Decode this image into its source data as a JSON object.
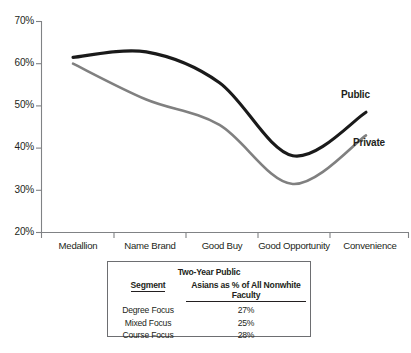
{
  "chart_data": {
    "type": "line",
    "title": "",
    "xlabel": "",
    "ylabel": "",
    "ylim": [
      20,
      70
    ],
    "ytick_labels": [
      "70%",
      "60%",
      "50%",
      "40%",
      "30%",
      "20%"
    ],
    "ytick_values": [
      70,
      60,
      50,
      40,
      30,
      20
    ],
    "grid": false,
    "legend_position": "inline-right-of-line-ends",
    "categories": [
      "Medallion",
      "Name Brand",
      "Good Buy",
      "Good Opportunity",
      "Convenience"
    ],
    "series": [
      {
        "name": "Public",
        "color": "#1a1a1a",
        "values": [
          61.5,
          62.8,
          55.5,
          38.2,
          48.5
        ]
      },
      {
        "name": "Private",
        "color": "#808080",
        "values": [
          60.0,
          51.5,
          45.5,
          31.5,
          43.0
        ]
      }
    ],
    "annotations": [
      {
        "text": "Public",
        "series": "Public"
      },
      {
        "text": "Private",
        "series": "Private"
      }
    ]
  },
  "table": {
    "title": "Two-Year Public",
    "columns": [
      "Segment",
      "Asians as % of All Nonwhite Faculty"
    ],
    "rows": [
      {
        "segment": "Degree Focus",
        "value": "27%"
      },
      {
        "segment": "Mixed Focus",
        "value": "25%"
      },
      {
        "segment": "Course Focus",
        "value": "28%"
      }
    ]
  },
  "colors": {
    "public_line": "#1a1a1a",
    "private_line": "#808080",
    "axis": "#808285",
    "text": "#231f20",
    "table_border": "#6d6e71"
  }
}
